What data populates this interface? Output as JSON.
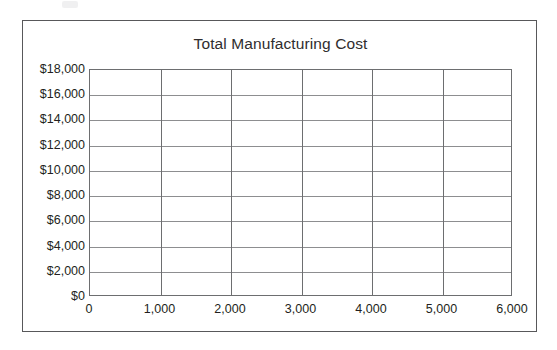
{
  "figure": {
    "title": "Total Manufacturing Cost",
    "background_color": "#ffffff",
    "frame_color": "#58585a",
    "axis_color": "#6d6e70",
    "gridline_color": "#8d8e90",
    "text_color": "#231f20"
  },
  "chart_data": {
    "type": "line",
    "title": "Total Manufacturing Cost",
    "xlabel": "",
    "ylabel": "",
    "series": [],
    "x": [],
    "categories": [],
    "values": [],
    "xlim": [
      0,
      6000
    ],
    "ylim": [
      0,
      18000
    ],
    "x_tick_values": [
      0,
      1000,
      2000,
      3000,
      4000,
      5000,
      6000
    ],
    "x_tick_labels": [
      "0",
      "1,000",
      "2,000",
      "3,000",
      "4,000",
      "5,000",
      "6,000"
    ],
    "y_tick_values": [
      0,
      2000,
      4000,
      6000,
      8000,
      10000,
      12000,
      14000,
      16000,
      18000
    ],
    "y_tick_labels": [
      "$0",
      "$2,000",
      "$4,000",
      "$6,000",
      "$8,000",
      "$10,000",
      "$12,000",
      "$14,000",
      "$16,000",
      "$18,000"
    ],
    "grid": true,
    "grid_axes": "both",
    "legend": false,
    "legend_position": "none",
    "annotations": [],
    "note": "Empty plotting grid; no data series are plotted in the figure."
  }
}
